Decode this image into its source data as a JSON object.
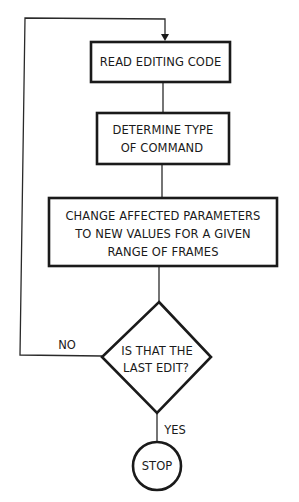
{
  "flowchart": {
    "nodes": [
      {
        "id": "read",
        "type": "process",
        "lines": [
          "READ EDITING CODE"
        ]
      },
      {
        "id": "determine",
        "type": "process",
        "lines": [
          "DETERMINE TYPE",
          "OF COMMAND"
        ]
      },
      {
        "id": "change",
        "type": "process",
        "lines": [
          "CHANGE AFFECTED PARAMETERS",
          "TO NEW VALUES FOR A GIVEN",
          "RANGE OF FRAMES"
        ]
      },
      {
        "id": "decision",
        "type": "decision",
        "lines": [
          "IS THAT THE",
          "LAST EDIT?"
        ]
      },
      {
        "id": "stop",
        "type": "terminal",
        "lines": [
          "STOP"
        ]
      }
    ],
    "edges": [
      {
        "from": "read",
        "to": "determine",
        "label": ""
      },
      {
        "from": "determine",
        "to": "change",
        "label": ""
      },
      {
        "from": "change",
        "to": "decision",
        "label": ""
      },
      {
        "from": "decision",
        "to": "read",
        "label": "NO"
      },
      {
        "from": "decision",
        "to": "stop",
        "label": "YES"
      }
    ],
    "labels": {
      "no": "NO",
      "yes": "YES"
    }
  }
}
